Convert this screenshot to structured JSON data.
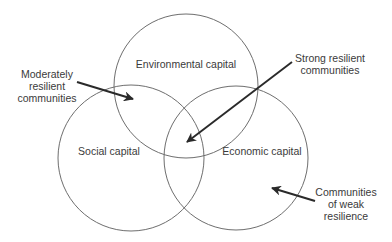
{
  "diagram": {
    "type": "venn",
    "circles": [
      {
        "id": "environmental",
        "label": "Environmental capital",
        "cx": 186,
        "cy": 86,
        "r": 72
      },
      {
        "id": "social",
        "label": "Social capital",
        "cx": 131,
        "cy": 158,
        "r": 73
      },
      {
        "id": "economic",
        "label": "Economic capital",
        "cx": 236,
        "cy": 158,
        "r": 72
      }
    ],
    "annotations": [
      {
        "id": "moderately",
        "lines": [
          "Moderately",
          "resilient",
          "communities"
        ],
        "arrow_from": [
          77,
          82
        ],
        "arrow_to": [
          133,
          99
        ]
      },
      {
        "id": "strong",
        "lines": [
          "Strong resilient",
          "communities"
        ],
        "arrow_from": [
          292,
          62
        ],
        "arrow_to": [
          187,
          142
        ]
      },
      {
        "id": "weak",
        "lines": [
          "Communities",
          "of weak",
          "resilience"
        ],
        "arrow_from": [
          315,
          201
        ],
        "arrow_to": [
          272,
          188
        ]
      }
    ],
    "colors": {
      "circle_stroke": "#6e6e6e",
      "arrow": "#2a2a2a",
      "text": "#3a3a3a",
      "background": "#ffffff"
    }
  }
}
